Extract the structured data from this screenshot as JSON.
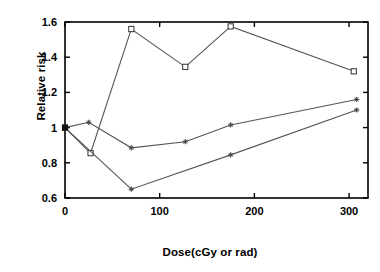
{
  "chart_data": {
    "type": "line",
    "title": "",
    "subtitle": "",
    "xlabel": "Dose(cGy or rad)",
    "ylabel": "Relative risk",
    "xlim": [
      0,
      320
    ],
    "ylim": [
      0.6,
      1.6
    ],
    "xticks": [
      0,
      100,
      200,
      300
    ],
    "xtick_labels": [
      "0",
      "100",
      "200",
      "300"
    ],
    "yticks": [
      0.6,
      0.8,
      1.0,
      1.2,
      1.4,
      1.6
    ],
    "ytick_labels": [
      "0.6",
      "0.8",
      "1",
      "1.2",
      "1.4",
      "1.6"
    ],
    "grid": false,
    "legend": "none",
    "line_color": "#555555",
    "marker_color": "#444444",
    "axis_color": "#000000",
    "series": [
      {
        "name": "series-squares",
        "marker": "square",
        "x": [
          0,
          27,
          70,
          127,
          175,
          305
        ],
        "y": [
          1.0,
          0.855,
          1.56,
          1.345,
          1.575,
          1.32
        ]
      },
      {
        "name": "series-upper-crosses",
        "marker": "cross",
        "x": [
          0,
          25,
          70,
          127,
          175,
          308
        ],
        "y": [
          1.0,
          1.03,
          0.885,
          0.92,
          1.015,
          1.16
        ]
      },
      {
        "name": "series-lower-crosses",
        "marker": "cross",
        "x": [
          0,
          70,
          175,
          308
        ],
        "y": [
          1.0,
          0.65,
          0.845,
          1.1
        ]
      }
    ]
  }
}
